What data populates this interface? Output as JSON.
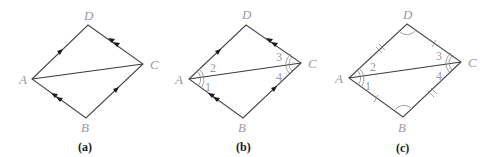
{
  "figures": [
    {
      "id": "a",
      "caption": "(a)",
      "vertices": {
        "A": [
          32,
          79
        ],
        "B": [
          86,
          118
        ],
        "C": [
          143,
          64
        ],
        "D": [
          88,
          25
        ]
      },
      "labels": {
        "A": "A",
        "B": "B",
        "C": "C",
        "D": "D"
      },
      "markings": "parallel-arrows: AD & BC single arrow, AB & DC double arrow; diagonal AC"
    },
    {
      "id": "b",
      "caption": "(b)",
      "vertices": {
        "A": [
          189,
          79
        ],
        "B": [
          243,
          118
        ],
        "C": [
          301,
          63
        ],
        "D": [
          246,
          25
        ]
      },
      "labels": {
        "A": "A",
        "B": "B",
        "C": "C",
        "D": "D"
      },
      "angles": [
        "1",
        "2",
        "3",
        "4"
      ],
      "markings": "parallel-arrows as in (a); double arcs at A (angles 1,2) and C (angles 3,4)"
    },
    {
      "id": "c",
      "caption": "(c)",
      "vertices": {
        "A": [
          349,
          78
        ],
        "B": [
          403,
          117
        ],
        "C": [
          461,
          62
        ],
        "D": [
          407,
          24
        ]
      },
      "labels": {
        "A": "A",
        "B": "B",
        "C": "C",
        "D": "D"
      },
      "angles": [
        "1",
        "2",
        "3",
        "4"
      ],
      "markings": "tick marks: AD & BC double tick, AB & DC single tick; arcs at B and D; double arcs at A and C"
    }
  ],
  "text": {
    "a": {
      "A": "A",
      "B": "B",
      "C": "C",
      "D": "D",
      "caption": "(a)"
    },
    "b": {
      "A": "A",
      "B": "B",
      "C": "C",
      "D": "D",
      "one": "1",
      "two": "2",
      "three": "3",
      "four": "4",
      "caption": "(b)"
    },
    "c": {
      "A": "A",
      "B": "B",
      "C": "C",
      "D": "D",
      "one": "1",
      "two": "2",
      "three": "3",
      "four": "4",
      "caption": "(c)"
    }
  }
}
